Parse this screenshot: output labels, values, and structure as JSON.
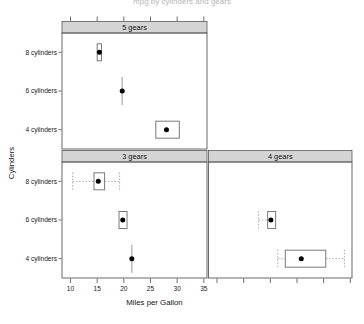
{
  "chart_data": {
    "type": "box",
    "title": "mpg by cylinders and gears",
    "xlabel": "Miles per Gallon",
    "ylabel": "Cylinders",
    "xlim": [
      8.4,
      35.6
    ],
    "xticks": [
      10,
      15,
      20,
      25,
      30,
      35
    ],
    "xtick_labels": [
      "10",
      "15",
      "20",
      "25",
      "30",
      "35"
    ],
    "ytick_labels": [
      "4 cylinders",
      "6 cylinders",
      "8 cylinders"
    ],
    "categories": [
      "4 cylinders",
      "6 cylinders",
      "8 cylinders"
    ],
    "grid": false,
    "legend": false,
    "panel_variable": "gears",
    "panels": [
      {
        "id": "panel-5-gears",
        "strip_label": "5 gears",
        "row": 0,
        "col": 0,
        "show_xtick_labels": false,
        "boxes": [
          {
            "category": "8 cylinders",
            "min": 15.0,
            "q1": 15.0,
            "median": 15.4,
            "q3": 15.8,
            "max": 15.8,
            "has_whiskers": false,
            "n": 2
          },
          {
            "category": "6 cylinders",
            "min": 18.3,
            "q1": 19.7,
            "median": 19.7,
            "q3": 19.7,
            "max": 21.1,
            "has_whiskers": false,
            "n": 1
          },
          {
            "category": "4 cylinders",
            "min": 26.0,
            "q1": 26.0,
            "median": 28.0,
            "q3": 30.4,
            "max": 30.4,
            "has_whiskers": false,
            "n": 2
          }
        ]
      },
      {
        "id": "panel-3-gears",
        "strip_label": "3 gears",
        "row": 1,
        "col": 0,
        "show_xtick_labels": true,
        "boxes": [
          {
            "category": "8 cylinders",
            "min": 10.4,
            "q1": 14.4,
            "median": 15.2,
            "q3": 16.4,
            "max": 19.2,
            "has_whiskers": true,
            "n": 12
          },
          {
            "category": "6 cylinders",
            "min": 18.9,
            "q1": 19.1,
            "median": 19.8,
            "q3": 20.6,
            "max": 21.4,
            "has_whiskers": false,
            "n": 2
          },
          {
            "category": "4 cylinders",
            "min": 20.3,
            "q1": 21.5,
            "median": 21.5,
            "q3": 21.5,
            "max": 22.7,
            "has_whiskers": false,
            "n": 1
          }
        ]
      },
      {
        "id": "panel-4-gears",
        "strip_label": "4 gears",
        "row": 1,
        "col": 1,
        "show_xtick_labels": false,
        "boxes": [
          {
            "category": "6 cylinders",
            "min": 17.8,
            "q1": 19.5,
            "median": 20.1,
            "q3": 21.0,
            "max": 21.0,
            "has_whiskers": true,
            "whisker_left_only": true,
            "n": 4
          },
          {
            "category": "4 cylinders",
            "min": 21.4,
            "q1": 22.8,
            "median": 25.8,
            "q3": 30.4,
            "max": 33.9,
            "has_whiskers": true,
            "n": 8
          }
        ]
      }
    ]
  },
  "colors": {
    "strip_background": "#d4d4d4",
    "panel_border": "#5a5a5a",
    "box_stroke": "#6b6b6b",
    "point_fill": "#000000",
    "whisker": "#9a9a9a",
    "axis": "#4a4a4a",
    "text": "#121212",
    "background": "#ffffff"
  }
}
